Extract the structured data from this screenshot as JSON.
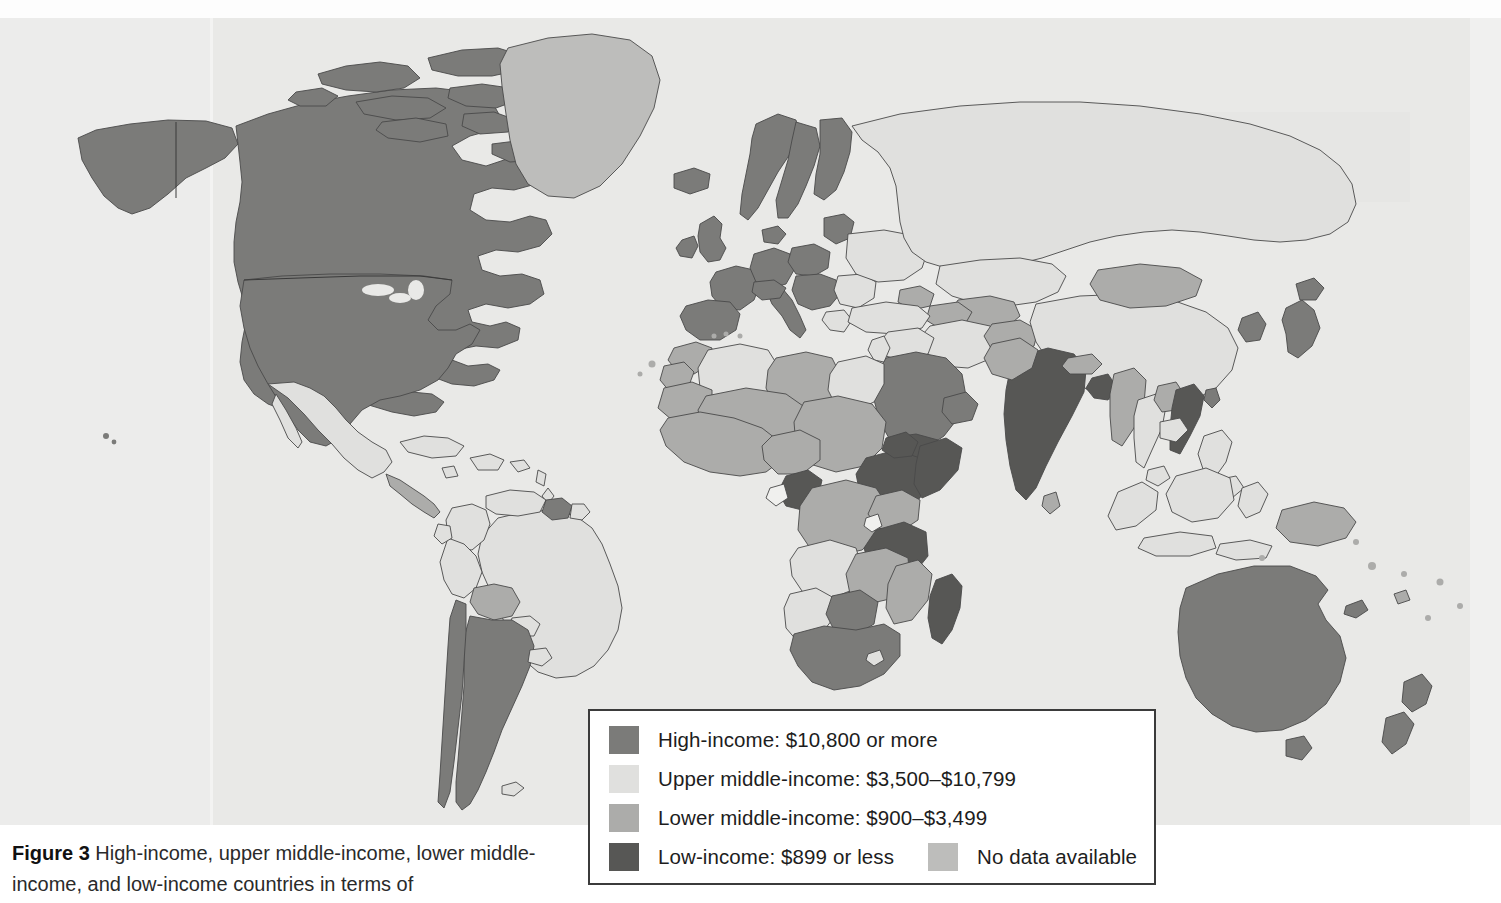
{
  "figure": {
    "number_label": "Figure 3",
    "caption_text": " High-income, upper middle-income, lower middle-income, and low-income countries in terms of"
  },
  "legend": {
    "items": [
      {
        "key": "high",
        "label": "High-income: $10,800 or more",
        "color": "#7b7b79"
      },
      {
        "key": "upper",
        "label": "Upper middle-income: $3,500–$10,799",
        "color": "#e0e0de"
      },
      {
        "key": "lower",
        "label": "Lower middle-income: $900–$3,499",
        "color": "#acacaa"
      },
      {
        "key": "low",
        "label": "Low-income: $899 or less",
        "color": "#575755"
      },
      {
        "key": "nodata",
        "label": "No data available",
        "color": "#bdbdbb"
      }
    ]
  },
  "map": {
    "background_color": "#e9e9e7",
    "border_color": "#4a4a4a",
    "projection": "world-equirectangular",
    "categories": {
      "high": "#7b7b79",
      "upper": "#e0e0de",
      "lower": "#acacaa",
      "low": "#575755",
      "nodata": "#bdbdbb"
    },
    "regions": [
      {
        "name": "united-states",
        "category": "high"
      },
      {
        "name": "canada",
        "category": "high"
      },
      {
        "name": "greenland",
        "category": "nodata"
      },
      {
        "name": "mexico",
        "category": "upper"
      },
      {
        "name": "central-america",
        "category": "lower"
      },
      {
        "name": "caribbean",
        "category": "upper"
      },
      {
        "name": "brazil",
        "category": "upper"
      },
      {
        "name": "argentina",
        "category": "high"
      },
      {
        "name": "chile",
        "category": "high"
      },
      {
        "name": "bolivia",
        "category": "lower"
      },
      {
        "name": "peru",
        "category": "upper"
      },
      {
        "name": "colombia",
        "category": "upper"
      },
      {
        "name": "venezuela",
        "category": "upper"
      },
      {
        "name": "guyana",
        "category": "high"
      },
      {
        "name": "western-europe",
        "category": "high"
      },
      {
        "name": "scandinavia",
        "category": "high"
      },
      {
        "name": "united-kingdom",
        "category": "high"
      },
      {
        "name": "iberia",
        "category": "high"
      },
      {
        "name": "italy",
        "category": "high"
      },
      {
        "name": "eastern-europe",
        "category": "upper"
      },
      {
        "name": "russia",
        "category": "upper"
      },
      {
        "name": "turkey",
        "category": "upper"
      },
      {
        "name": "north-africa",
        "category": "lower"
      },
      {
        "name": "west-africa",
        "category": "lower"
      },
      {
        "name": "ethiopia",
        "category": "low"
      },
      {
        "name": "tanzania",
        "category": "low"
      },
      {
        "name": "madagascar",
        "category": "low"
      },
      {
        "name": "south-africa",
        "category": "lower"
      },
      {
        "name": "angola",
        "category": "upper"
      },
      {
        "name": "namibia",
        "category": "upper"
      },
      {
        "name": "congo",
        "category": "low"
      },
      {
        "name": "arabian-peninsula",
        "category": "high"
      },
      {
        "name": "yemen",
        "category": "low"
      },
      {
        "name": "india",
        "category": "low"
      },
      {
        "name": "pakistan",
        "category": "lower"
      },
      {
        "name": "china",
        "category": "upper"
      },
      {
        "name": "mongolia",
        "category": "lower"
      },
      {
        "name": "japan",
        "category": "high"
      },
      {
        "name": "korea",
        "category": "high"
      },
      {
        "name": "vietnam",
        "category": "low"
      },
      {
        "name": "myanmar",
        "category": "lower"
      },
      {
        "name": "indonesia",
        "category": "upper"
      },
      {
        "name": "philippines",
        "category": "upper"
      },
      {
        "name": "australia",
        "category": "high"
      },
      {
        "name": "new-zealand",
        "category": "high"
      },
      {
        "name": "papua-new-guinea",
        "category": "lower"
      }
    ]
  }
}
